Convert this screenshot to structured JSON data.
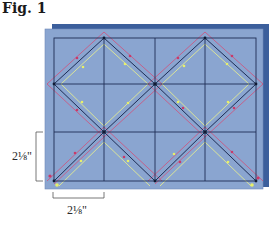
{
  "figure": {
    "title": "Fig. 1"
  },
  "dimensions": {
    "vertical_label": "2⅛\"",
    "horizontal_label": "2⅛\""
  },
  "colors": {
    "back_panel": "#3c5f9c",
    "front_panel": "#8aa5d0",
    "grid_line": "#1e2d55",
    "diamond_line": "#1e2d55",
    "outer_offset_line": "#d0507a",
    "inner_offset_line": "#eef28a",
    "bracket": "#555555"
  },
  "grid": {
    "columns": 4,
    "rows": 3
  },
  "markers": {
    "outer_arrows": "pink",
    "inner_arrows": "yellow"
  }
}
